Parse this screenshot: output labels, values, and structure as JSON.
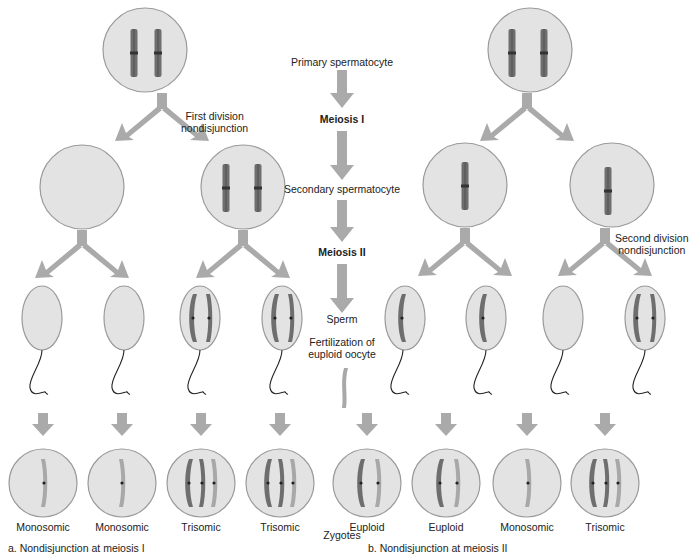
{
  "colors": {
    "cell_fill": "#e3e3e3",
    "cell_stroke": "#9a9a9a",
    "arrow": "#aaaaaa",
    "chromosome_dark": "#6e6e6e",
    "chromosome_light": "#a8a8a8",
    "tail": "#222222"
  },
  "center_column": {
    "primary": "Primary spermatocyte",
    "meiosis1": "Meiosis I",
    "secondary": "Secondary spermatocyte",
    "meiosis2": "Meiosis II",
    "sperm": "Sperm",
    "fertilization": "Fertilization of\neuploid oocyte",
    "fertilization_line1": "Fertilization of",
    "fertilization_line2": "euploid oocyte",
    "zygotes": "Zygotes"
  },
  "panel_a": {
    "caption": "a. Nondisjunction at meiosis I",
    "annotation_line1": "First division",
    "annotation_line2": "nondisjunction",
    "zygotes": [
      {
        "label": "Monosomic"
      },
      {
        "label": "Monosomic"
      },
      {
        "label": "Trisomic"
      },
      {
        "label": "Trisomic"
      }
    ]
  },
  "panel_b": {
    "caption": "b. Nondisjunction at meiosis II",
    "annotation_line1": "Second division",
    "annotation_line2": "nondisjunction",
    "zygotes": [
      {
        "label": "Euploid"
      },
      {
        "label": "Euploid"
      },
      {
        "label": "Monosomic"
      },
      {
        "label": "Trisomic"
      }
    ]
  }
}
